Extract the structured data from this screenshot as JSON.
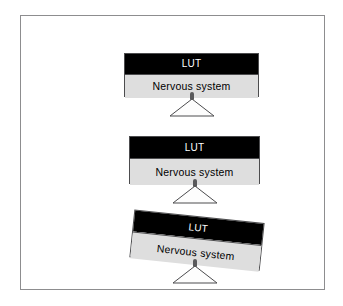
{
  "figure": {
    "frame": {
      "border_color": "#8d8d8f",
      "background": "#ffffff"
    },
    "colors": {
      "top_bar_fill": "#000000",
      "top_bar_text": "#ffffff",
      "bottom_bar_fill": "#dedede",
      "bottom_bar_text": "#000000",
      "outline": "#4c4c4e",
      "fulcrum_outline": "#4c4c4e",
      "pivot_pin": "#5a5a5c"
    },
    "panels": [
      {
        "id": "panel-1",
        "state": "balanced",
        "tilt_degrees": 0,
        "beam_width": 135,
        "top_bar": {
          "label": "LUT",
          "height": 20
        },
        "bottom_bar": {
          "label": "Nervous system",
          "height": 24
        }
      },
      {
        "id": "panel-2",
        "state": "balanced",
        "tilt_degrees": 0,
        "beam_width": 131,
        "top_bar": {
          "label": "LUT",
          "height": 21
        },
        "bottom_bar": {
          "label": "Nervous system",
          "height": 27
        }
      },
      {
        "id": "panel-3",
        "state": "tilted-right",
        "tilt_degrees": 6,
        "beam_width": 131,
        "top_bar": {
          "label": "LUT",
          "height": 21
        },
        "bottom_bar": {
          "label": "Nervous system",
          "height": 27
        }
      }
    ],
    "fulcrum": {
      "icon": "triangle-support-icon",
      "pivot_icon": "pivot-pin-icon",
      "triangle_width": 46,
      "triangle_height": 19
    }
  }
}
